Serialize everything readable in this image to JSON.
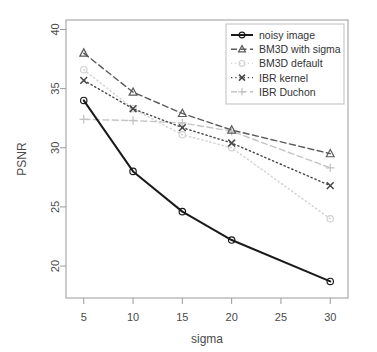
{
  "chart_data": {
    "type": "line",
    "title": "",
    "xlabel": "sigma",
    "ylabel": "PSNR",
    "x": [
      5,
      10,
      15,
      20,
      30
    ],
    "xticks": [
      "5",
      "10",
      "15",
      "20",
      "25",
      "30"
    ],
    "xtick_values": [
      5,
      10,
      15,
      20,
      25,
      30
    ],
    "yticks": [
      "20",
      "25",
      "30",
      "35",
      "40"
    ],
    "ytick_values": [
      20,
      25,
      30,
      35,
      40
    ],
    "xlim": [
      3.2,
      31.8
    ],
    "ylim": [
      17.3,
      40.8
    ],
    "grid": false,
    "legend_position": "top-right",
    "series": [
      {
        "name": "noisy image",
        "values": [
          34.0,
          28.0,
          24.6,
          22.2,
          18.7
        ],
        "color": "#1a1a1a",
        "marker": "circle",
        "linestyle": "solid",
        "linewidth": 2.0
      },
      {
        "name": "BM3D with sigma",
        "values": [
          38.0,
          34.7,
          32.9,
          31.5,
          29.5
        ],
        "color": "#5a5a5a",
        "marker": "triangle",
        "linestyle": "dashed",
        "linewidth": 1.4
      },
      {
        "name": "BM3D default",
        "values": [
          36.6,
          33.3,
          31.1,
          30.0,
          24.0
        ],
        "color": "#d2d2d2",
        "marker": "circle",
        "linestyle": "dotted",
        "linewidth": 1.4
      },
      {
        "name": "IBR kernel",
        "values": [
          35.7,
          33.3,
          31.7,
          30.4,
          26.8
        ],
        "color": "#464646",
        "marker": "cross",
        "linestyle": "dotted",
        "linewidth": 1.4
      },
      {
        "name": "IBR Duchon",
        "values": [
          32.4,
          32.3,
          32.1,
          31.4,
          28.3
        ],
        "color": "#c4c4c4",
        "marker": "plus",
        "linestyle": "dashed",
        "linewidth": 1.4
      }
    ]
  },
  "legend": {
    "entries": [
      {
        "label": "noisy image"
      },
      {
        "label": "BM3D with sigma"
      },
      {
        "label": "BM3D default"
      },
      {
        "label": "IBR kernel"
      },
      {
        "label": "IBR Duchon"
      }
    ]
  },
  "axes": {
    "x_title": "sigma",
    "y_title": "PSNR"
  }
}
